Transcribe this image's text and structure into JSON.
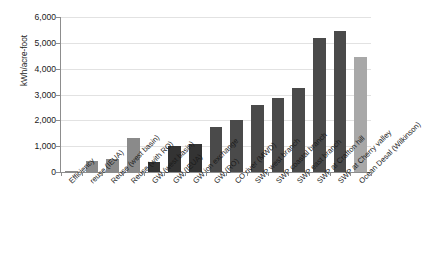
{
  "chart_data": {
    "type": "bar",
    "title": "",
    "xlabel": "",
    "ylabel": "kWh/acre-foot",
    "ylim": [
      0,
      6000
    ],
    "ytick_labels": [
      "6,000",
      "5,000",
      "4,000",
      "3,000",
      "2,000",
      "1,000",
      "0"
    ],
    "ytick_values": [
      6000,
      5000,
      4000,
      3000,
      2000,
      1000,
      0
    ],
    "grid": true,
    "legend": "none",
    "categories": [
      "Efficiency",
      "reuse (IEUA)",
      "Reuse (west basin)",
      "Reuse (with RO)",
      "GW (west basin)",
      "GW (IEUA)",
      "GW ion exchange",
      "GW (RO)",
      "CO river (MWD)",
      "SWP west branch",
      "SWP coastal branch",
      "SWP east branch",
      "SWP at Crafton hill",
      "SWP at Cherry valley",
      "Ocean Desal (Wilkinson)"
    ],
    "values": [
      20,
      430,
      500,
      1300,
      380,
      1000,
      1100,
      1750,
      2000,
      2600,
      2850,
      3250,
      5200,
      5450,
      4450
    ],
    "bar_colors": [
      "#8a8a8a",
      "#8a8a8a",
      "#8a8a8a",
      "#8a8a8a",
      "#333333",
      "#333333",
      "#333333",
      "#4a4a4a",
      "#4a4a4a",
      "#4a4a4a",
      "#4a4a4a",
      "#4a4a4a",
      "#4a4a4a",
      "#4a4a4a",
      "#a8a8a8"
    ]
  },
  "axis": {
    "gridline_color": "#e2e2e2",
    "axis_color": "#8d8d8d"
  }
}
